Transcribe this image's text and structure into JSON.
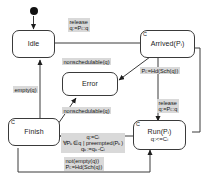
{
  "diagram": {
    "kind": "uml-state-machine",
    "colors": {
      "stroke": "#3a3a3a",
      "fill": "#ffffff",
      "label_background": "#d9d9d9",
      "text": "#141414",
      "initial_dot": "#111111"
    },
    "initial_node": {
      "name": "initial-state-dot"
    },
    "states": [
      {
        "id": "idle",
        "label": "Idle",
        "sub": "",
        "composite_marker": ""
      },
      {
        "id": "arrived",
        "label": "Arrived(Pᵢ)",
        "sub": "",
        "composite_marker": "C"
      },
      {
        "id": "error",
        "label": "Error",
        "sub": "",
        "composite_marker": ""
      },
      {
        "id": "finish",
        "label": "Finish",
        "sub": "",
        "composite_marker": "C"
      },
      {
        "id": "run",
        "label": "Run(Pᵢ)",
        "sub": "q:<=Cᵢ",
        "composite_marker": "C"
      }
    ],
    "transitions": [
      {
        "id": "t-idle-arrived",
        "from": "idle",
        "to": "arrived",
        "line1": "release",
        "line2": "q:=Pᵢ::q"
      },
      {
        "id": "t-arrived-error",
        "from": "arrived",
        "to": "error",
        "line1": "nonschedulable(q)",
        "line2": ""
      },
      {
        "id": "t-arrived-run",
        "from": "arrived",
        "to": "run",
        "line1": "Pᵢ:=Hd(Sch(q))",
        "line2": ""
      },
      {
        "id": "t-run-arrived",
        "from": "run",
        "to": "arrived",
        "line1": "release",
        "line2": "q:=Pᵢ::q"
      },
      {
        "id": "t-finish-error",
        "from": "finish",
        "to": "error",
        "line1": "nonschedulable(q)",
        "line2": ""
      },
      {
        "id": "t-finish-idle",
        "from": "finish",
        "to": "idle",
        "line1": "empty(q)",
        "line2": ""
      },
      {
        "id": "t-run-finish",
        "from": "run",
        "to": "finish",
        "line1": "q:=Cᵢ",
        "line2": "∀Pₖ∈q | preempted(Pₖ)",
        "line3": "qₖ:=qₖ-Cᵢ"
      },
      {
        "id": "t-finish-run",
        "from": "finish",
        "to": "run",
        "line1": "not(empty(q))",
        "line2": "Pᵢ:=Hd(Sch(q))"
      }
    ]
  }
}
